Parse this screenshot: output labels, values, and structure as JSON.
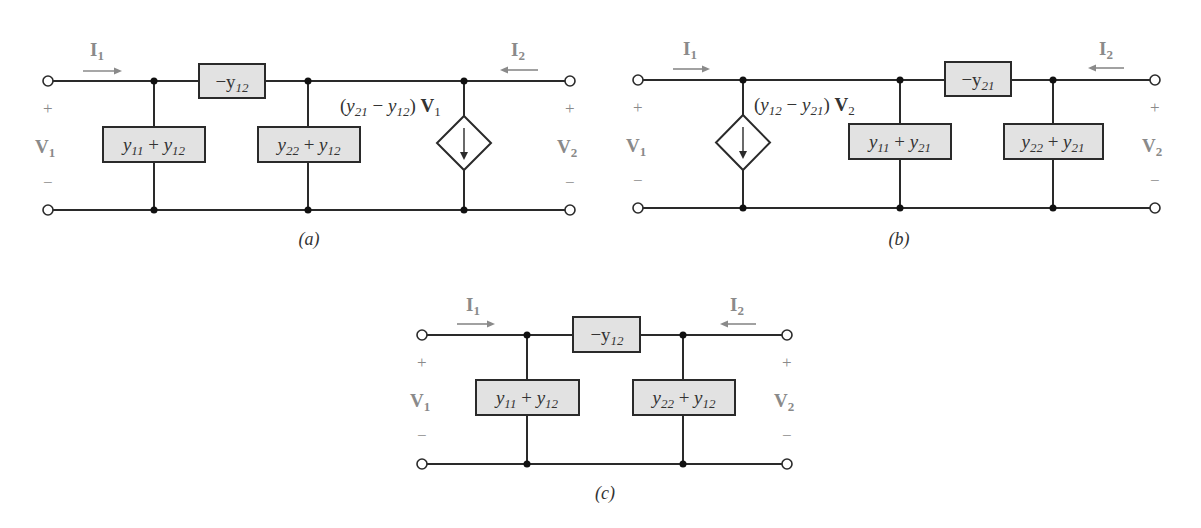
{
  "figure": {
    "circuits": [
      {
        "id": "a",
        "caption": "(a)",
        "port1": {
          "current": "I",
          "current_sub": "1",
          "voltage": "V",
          "voltage_sub": "1",
          "plus": "+",
          "minus": "−"
        },
        "port2": {
          "current": "I",
          "current_sub": "2",
          "voltage": "V",
          "voltage_sub": "2",
          "plus": "+",
          "minus": "−"
        },
        "series_element": {
          "prefix": "−y",
          "sub": "12"
        },
        "shunt_left": {
          "a": "y",
          "a_sub": "11",
          "op": " + ",
          "b": "y",
          "b_sub": "12"
        },
        "shunt_right": {
          "a": "y",
          "a_sub": "22",
          "op": " + ",
          "b": "y",
          "b_sub": "12"
        },
        "dependent_source": {
          "position": "right",
          "label": {
            "open": "(",
            "a": "y",
            "a_sub": "21",
            "op": " − ",
            "b": "y",
            "b_sub": "12",
            "close": ") ",
            "ctrl": "V",
            "ctrl_sub": "1"
          }
        }
      },
      {
        "id": "b",
        "caption": "(b)",
        "port1": {
          "current": "I",
          "current_sub": "1",
          "voltage": "V",
          "voltage_sub": "1",
          "plus": "+",
          "minus": "−"
        },
        "port2": {
          "current": "I",
          "current_sub": "2",
          "voltage": "V",
          "voltage_sub": "2",
          "plus": "+",
          "minus": "−"
        },
        "series_element": {
          "prefix": "−y",
          "sub": "21"
        },
        "shunt_left": {
          "a": "y",
          "a_sub": "11",
          "op": " + ",
          "b": "y",
          "b_sub": "21"
        },
        "shunt_right": {
          "a": "y",
          "a_sub": "22",
          "op": " + ",
          "b": "y",
          "b_sub": "21"
        },
        "dependent_source": {
          "position": "left",
          "label": {
            "open": "(",
            "a": "y",
            "a_sub": "12",
            "op": " − ",
            "b": "y",
            "b_sub": "21",
            "close": ") ",
            "ctrl": "V",
            "ctrl_sub": "2"
          }
        }
      },
      {
        "id": "c",
        "caption": "(c)",
        "port1": {
          "current": "I",
          "current_sub": "1",
          "voltage": "V",
          "voltage_sub": "1",
          "plus": "+",
          "minus": "−"
        },
        "port2": {
          "current": "I",
          "current_sub": "2",
          "voltage": "V",
          "voltage_sub": "2",
          "plus": "+",
          "minus": "−"
        },
        "series_element": {
          "prefix": "−y",
          "sub": "12"
        },
        "shunt_left": {
          "a": "y",
          "a_sub": "11",
          "op": " + ",
          "b": "y",
          "b_sub": "12"
        },
        "shunt_right": {
          "a": "y",
          "a_sub": "22",
          "op": " + ",
          "b": "y",
          "b_sub": "12"
        }
      }
    ],
    "colors": {
      "wire": "#2a2a2a",
      "box_fill": "#e2e2e2",
      "label_gray": "#8a8a8a"
    }
  }
}
